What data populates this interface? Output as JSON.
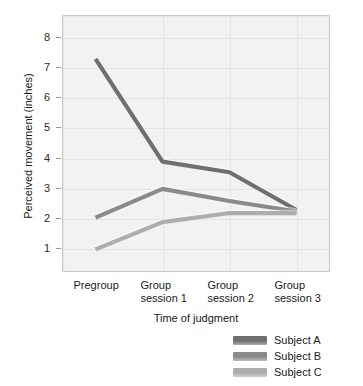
{
  "chart_data": {
    "type": "line",
    "title": "",
    "xlabel": "Time of judgment",
    "ylabel": "Perceived movement (inches)",
    "categories": [
      "Pregroup",
      "Group\nsession 1",
      "Group\nsession 2",
      "Group\nsession 3"
    ],
    "yticks": [
      1,
      2,
      3,
      4,
      5,
      6,
      7,
      8
    ],
    "ylim": [
      0.25,
      8.75
    ],
    "grid": true,
    "legend_position": "below-right",
    "series": [
      {
        "name": "Subject A",
        "color": "#6f6f6f",
        "values": [
          7.3,
          3.9,
          3.55,
          2.3
        ]
      },
      {
        "name": "Subject B",
        "color": "#8a8a8a",
        "values": [
          2.05,
          3.0,
          2.6,
          2.25
        ]
      },
      {
        "name": "Subject C",
        "color": "#adadad",
        "values": [
          1.0,
          1.9,
          2.2,
          2.2
        ]
      }
    ],
    "colors": {
      "plot_background": "#f2f2f2",
      "gridline": "#e3e3e3",
      "frame_border": "#c9c9c9",
      "text": "#1a1a1a"
    }
  },
  "ytick_labels": [
    "8",
    "7",
    "6",
    "5",
    "4",
    "3",
    "2",
    "1"
  ],
  "xtick_labels": [
    "Pregroup",
    "Group\nsession 1",
    "Group\nsession 2",
    "Group\nsession 3"
  ],
  "legend": {
    "items": [
      {
        "label": "Subject A"
      },
      {
        "label": "Subject B"
      },
      {
        "label": "Subject C"
      }
    ]
  },
  "axis_titles": {
    "x": "Time of judgment",
    "y": "Perceived movement (inches)"
  }
}
